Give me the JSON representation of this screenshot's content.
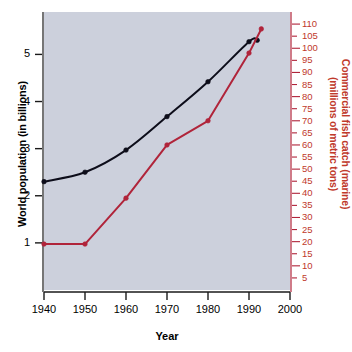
{
  "chart_data": {
    "type": "line",
    "title": "",
    "xlabel": "Year",
    "xlim": [
      1940,
      2000
    ],
    "xticks": [
      1940,
      1950,
      1960,
      1970,
      1980,
      1990,
      2000
    ],
    "grid": false,
    "legend": "none",
    "axes": [
      {
        "id": "left",
        "label": "World population (in billions)",
        "color": "#000000",
        "lim": [
          0,
          5.9
        ],
        "ticks": [
          1,
          2,
          3,
          4,
          5
        ],
        "ticklabels": [
          "1",
          "2",
          "3",
          "4",
          "5"
        ]
      },
      {
        "id": "right",
        "label": "Commercial fish catch (marine) (millions of metric tons)",
        "label_line1": "Commercial fish catch (marine)",
        "label_line2": "(millions of metric tons)",
        "color": "#c0392b",
        "lim": [
          0,
          115
        ],
        "ticks": [
          5,
          10,
          15,
          20,
          25,
          30,
          35,
          40,
          45,
          50,
          55,
          60,
          65,
          70,
          75,
          80,
          85,
          90,
          95,
          100,
          105,
          110
        ],
        "ticklabels": [
          "5",
          "10",
          "15",
          "20",
          "25",
          "30",
          "35",
          "40",
          "45",
          "50",
          "55",
          "60",
          "65",
          "70",
          "75",
          "80",
          "85",
          "90",
          "95",
          "100",
          "105",
          "110"
        ]
      }
    ],
    "series": [
      {
        "name": "World population (in billions)",
        "axis": "left",
        "color": "#0d0d1a",
        "marker": "filled-circle",
        "smooth": true,
        "x": [
          1940,
          1950,
          1960,
          1970,
          1980,
          1990,
          1992
        ],
        "values": [
          2.3,
          2.5,
          2.97,
          3.68,
          4.42,
          5.27,
          5.3
        ]
      },
      {
        "name": "Commercial fish catch (marine)",
        "axis": "right",
        "color": "#b0243a",
        "marker": "filled-circle",
        "smooth": false,
        "x": [
          1940,
          1950,
          1960,
          1970,
          1980,
          1990,
          1993
        ],
        "values": [
          19,
          19,
          38,
          60,
          70,
          98,
          108
        ]
      }
    ]
  },
  "figure": {
    "background": "#ffffff",
    "plot_background": "#ccd0dc",
    "xlabel": "Year",
    "ylabel_left": "World population (in billions)",
    "ylabel_right_line1": "Commercial fish catch (marine)",
    "ylabel_right_line2": "(millions of metric tons)"
  }
}
